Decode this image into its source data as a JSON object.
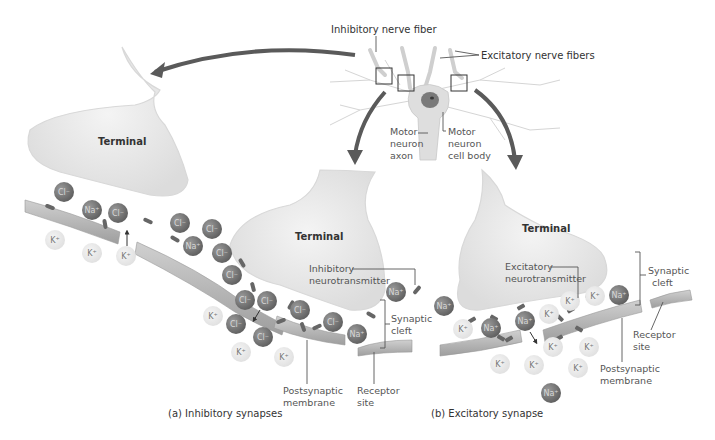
{
  "figure": {
    "caption_a": "(a)  Inhibitory synapses",
    "caption_b": "(b)  Excitatory synapse"
  },
  "overview": {
    "inhibitory_fiber_label": "Inhibitory nerve fiber",
    "excitatory_fibers_label": "Excitatory nerve fibers",
    "motor_axon_label": [
      "Motor",
      "neuron",
      "axon"
    ],
    "motor_body_label": [
      "Motor",
      "neuron",
      "cell body"
    ]
  },
  "terminals": {
    "left": "Terminal",
    "middle": "Terminal",
    "right": "Terminal"
  },
  "inhibitory_panel": {
    "neurotransmitter_label": [
      "Inhibitory",
      "neurotransmitter"
    ],
    "cleft_label": [
      "Synaptic",
      "cleft"
    ],
    "postsynaptic_label": [
      "Postsynaptic",
      "membrane"
    ],
    "receptor_label": [
      "Receptor",
      "site"
    ]
  },
  "excitatory_panel": {
    "neurotransmitter_label": [
      "Excitatory",
      "neurotransmitter"
    ],
    "cleft_label": [
      "Synaptic",
      "cleft"
    ],
    "postsynaptic_label": [
      "Postsynaptic",
      "membrane"
    ],
    "receptor_label": [
      "Receptor",
      "site"
    ]
  },
  "ions": {
    "chloride": "Cl⁻",
    "sodium": "Na⁺",
    "potassium": "K⁺"
  },
  "colors": {
    "terminal_fill": "#e6e6e6",
    "membrane_fill": "#b5b5b5",
    "dark_ion": "#7a7a7a",
    "light_ion": "#e8e8e8",
    "arrow": "#5a5a5a",
    "transmitter": "#6a6a6a"
  }
}
